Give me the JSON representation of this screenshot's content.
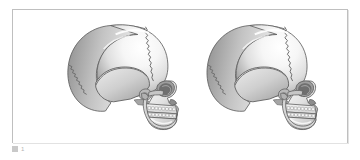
{
  "page": {
    "background_color": "#ffffff",
    "width": 360,
    "height": 160
  },
  "figure": {
    "frame": {
      "border_color": "#bfbfbf",
      "fill_color": "#ffffff",
      "shadow_color": "#e2e2e2"
    },
    "caption": {
      "marker_glyph": "图",
      "label": "图",
      "number": "1",
      "text_color": "#b4b4b4"
    },
    "illustration": {
      "type": "medical-anatomy-render",
      "subject": "human skull",
      "view": "lateral (side) profile",
      "style": "grayscale shaded 3D render",
      "count": 2,
      "palette": {
        "bone_light": "#fdfdfd",
        "bone_mid": "#dcdcdc",
        "bone_shadow": "#9a9a9a",
        "bone_deep_shadow": "#6f6f6f",
        "outline": "#5e5e5e",
        "suture_line": "#6a6a6a",
        "tooth_fill": "#efefef",
        "tooth_outline": "#8a8a8a"
      },
      "items": [
        {
          "name": "skull-left",
          "orientation": "facing right",
          "features": [
            "cranial vault",
            "coronal suture",
            "squamosal suture",
            "lambdoid suture",
            "temporal bone",
            "orbit",
            "zygomatic arch",
            "nasal aperture",
            "maxilla with tooth row",
            "mandible"
          ]
        },
        {
          "name": "skull-right",
          "orientation": "facing right, slight oblique rotation",
          "features": [
            "cranial vault",
            "coronal suture",
            "squamosal suture",
            "lambdoid suture",
            "temporal bone",
            "orbit",
            "zygomatic arch",
            "nasal aperture",
            "maxilla with tooth row",
            "mandible"
          ]
        }
      ]
    }
  }
}
